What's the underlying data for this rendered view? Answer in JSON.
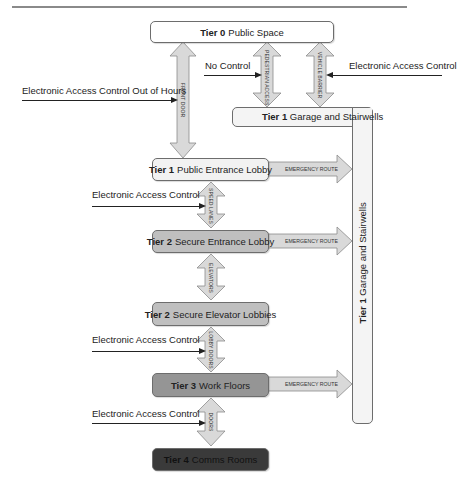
{
  "diagram": {
    "tiers": {
      "tier0": {
        "tier": "Tier 0",
        "name": "Public Space",
        "fill": "#ffffff"
      },
      "tier1_garage": {
        "tier": "Tier 1",
        "name": "Garage and  Stairwells",
        "fill": "#f4f4f4"
      },
      "tier1_lobby": {
        "tier": "Tier 1",
        "name": "Public Entrance Lobby",
        "fill": "#f2f2f2"
      },
      "tier2_entrance": {
        "tier": "Tier 2",
        "name": "Secure Entrance Lobby",
        "fill": "#bfbfbf"
      },
      "tier2_elevator": {
        "tier": "Tier 2",
        "name": "Secure Elevator Lobbies",
        "fill": "#bfbfbf"
      },
      "tier3": {
        "tier": "Tier 3",
        "name": "Work Floors",
        "fill": "#959595"
      },
      "tier4": {
        "tier": "Tier 4",
        "name": "Comms Rooms",
        "fill": "#3a3a3a"
      }
    },
    "connectors": {
      "front_door": "FRONT DOOR",
      "pedestrian_access": "PEDESTRIAN ACCESS",
      "vehicle_barrier": "VEHICLE BARRIER",
      "speed_lanes": "SPEED LANES",
      "elevators": "ELEVATORS",
      "lobby_doors": "LOBBY DOORS",
      "doors": "DOORS",
      "emergency_route": "EMERGENCY ROUTE"
    },
    "controls": {
      "out_of_hours": "Electronic Access Control Out of Hours",
      "no_control": "No Control",
      "eac_vehicle": "Electronic Access Control",
      "eac_speed_lanes": "Electronic Access Control",
      "eac_lobby_doors": "Electronic Access Control",
      "eac_doors": "Electronic Access Control"
    },
    "colors": {
      "arrow_fill": "#d9d9d9",
      "arrow_stroke": "#8c8c8c",
      "box_stroke": "#6d6d6d",
      "line": "#222222"
    }
  }
}
